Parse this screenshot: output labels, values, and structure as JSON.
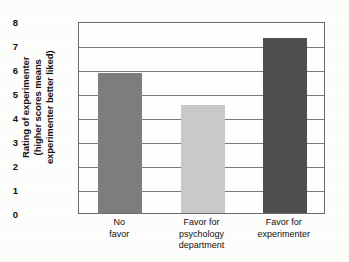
{
  "chart_data": {
    "type": "bar",
    "title": "",
    "xlabel": "",
    "ylabel": "Rating of experimenter (higher scores means experimenter better liked)",
    "ylabel_lines": [
      "Rating of experimenter",
      "(higher scores means",
      "experimenter better liked)"
    ],
    "categories": [
      "No favor",
      "Favor for psychology department",
      "Favor for experimenter"
    ],
    "category_lines": [
      [
        "No",
        "favor"
      ],
      [
        "Favor for",
        "psychology",
        "department"
      ],
      [
        "Favor for",
        "experimenter"
      ]
    ],
    "values": [
      5.85,
      4.5,
      7.3
    ],
    "ylim": [
      0,
      8
    ],
    "ytick_values": [
      0,
      1,
      2,
      3,
      4,
      5,
      6,
      7,
      8
    ],
    "ytick_labels": [
      "0",
      "1",
      "2",
      "3",
      "4",
      "5",
      "6",
      "7",
      "8"
    ],
    "grid": true,
    "legend": "none",
    "bar_colors": [
      "#7d7d7d",
      "#c9c9c9",
      "#4f4f4f"
    ],
    "frame_color": "#6b6b6b",
    "grid_color": "#7a7a7a",
    "background": "#fdfdfb"
  }
}
